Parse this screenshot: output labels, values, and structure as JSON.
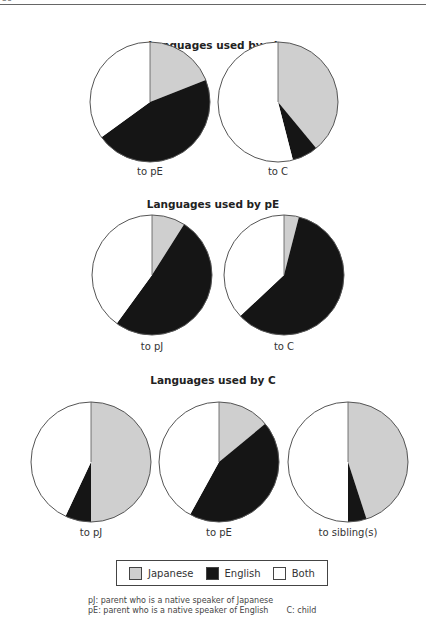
{
  "header": {
    "page_number": "38"
  },
  "colors": {
    "Japanese": "#cfcfcf",
    "English": "#151515",
    "Both": "#ffffff",
    "outline": "#555555"
  },
  "legend": {
    "items": [
      {
        "label": "Japanese",
        "color": "#cfcfcf"
      },
      {
        "label": "English",
        "color": "#151515"
      },
      {
        "label": "Both",
        "color": "#ffffff"
      }
    ]
  },
  "notes": {
    "pJ": "pJ: parent who is a native speaker of Japanese",
    "pE": "pE: parent who is a native speaker of English",
    "C": "C: child"
  },
  "groups": [
    {
      "title": "Languages used by pJ",
      "labels": [
        "to pE",
        "to C"
      ]
    },
    {
      "title": "Languages used by pE",
      "labels": [
        "to pJ",
        "to C"
      ]
    },
    {
      "title": "Languages used by C",
      "labels": [
        "to pJ",
        "to pE",
        "to sibling(s)"
      ]
    }
  ],
  "chart_data": [
    {
      "type": "pie",
      "title": "Languages used by pJ",
      "categories": [
        "Japanese",
        "English",
        "Both"
      ],
      "series": [
        {
          "name": "to pE",
          "values": [
            19,
            46,
            35
          ]
        },
        {
          "name": "to C",
          "values": [
            39,
            7,
            54
          ]
        }
      ],
      "legend_position": "bottom",
      "unit": "%"
    },
    {
      "type": "pie",
      "title": "Languages used by pE",
      "categories": [
        "Japanese",
        "English",
        "Both"
      ],
      "series": [
        {
          "name": "to pJ",
          "values": [
            9,
            51,
            40
          ]
        },
        {
          "name": "to C",
          "values": [
            4,
            59,
            37
          ]
        }
      ],
      "legend_position": "bottom",
      "unit": "%"
    },
    {
      "type": "pie",
      "title": "Languages used by C",
      "categories": [
        "Japanese",
        "English",
        "Both"
      ],
      "series": [
        {
          "name": "to pJ",
          "values": [
            50,
            7,
            43
          ]
        },
        {
          "name": "to pE",
          "values": [
            14,
            44,
            42
          ]
        },
        {
          "name": "to sibling(s)",
          "values": [
            45,
            5,
            50
          ]
        }
      ],
      "legend_position": "bottom",
      "unit": "%"
    }
  ]
}
